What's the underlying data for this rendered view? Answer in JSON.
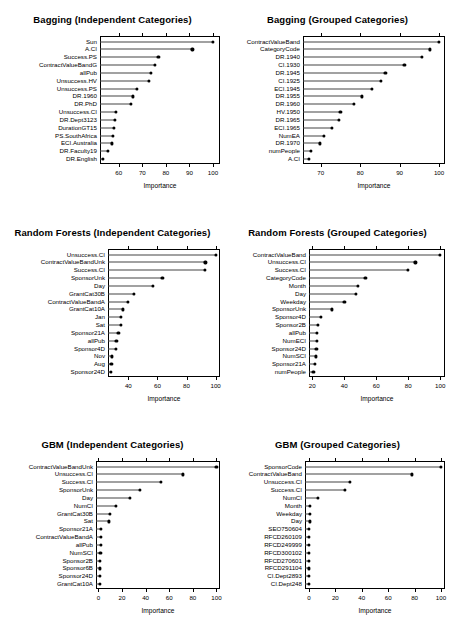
{
  "figure": {
    "kind": "variable-importance-dotplot-grid",
    "columns": 2,
    "rows": 3,
    "axis_title": "Importance"
  },
  "chart_data": [
    {
      "type": "scatter",
      "subtype": "dotchart",
      "title": "Bagging (Independent Categories)",
      "xlabel": "Importance",
      "ylabel": "",
      "xlim": [
        52,
        103
      ],
      "ticks": [
        60,
        70,
        80,
        90,
        100
      ],
      "grid": false,
      "categories": [
        "Sun",
        "A.CI",
        "Success.PS",
        "ContractValueBandG",
        "allPub",
        "Unsuccess.HV",
        "Unsuccess.PS",
        "DR.1960",
        "DR.PhD",
        "Unsuccess.CI",
        "DR.Dept3123",
        "DurationGT15",
        "PS.SouthAfrica",
        "ECI.Australia",
        "DR.Faculty19",
        "DR.English"
      ],
      "values": [
        100.0,
        91.3,
        76.8,
        75.2,
        73.6,
        72.8,
        67.6,
        65.9,
        65.3,
        58.9,
        58.3,
        57.8,
        57.6,
        57.0,
        55.4,
        53.2
      ]
    },
    {
      "type": "scatter",
      "subtype": "dotchart",
      "title": "Bagging (Grouped Categories)",
      "xlabel": "Importance",
      "ylabel": "",
      "xlim": [
        65.5,
        101.5
      ],
      "ticks": [
        70,
        80,
        90,
        100
      ],
      "grid": false,
      "categories": [
        "ContractValueBand",
        "CategoryCode",
        "DR.1940",
        "CI.1930",
        "DR.1945",
        "CI.1925",
        "ECI.1945",
        "DR.1955",
        "DR.1960",
        "HV.1950",
        "DR.1965",
        "ECI.1965",
        "NumEA",
        "DR.1970",
        "numPeople",
        "A.CI"
      ],
      "values": [
        100.0,
        97.6,
        95.7,
        91.2,
        86.4,
        85.3,
        83.0,
        80.4,
        78.5,
        75.0,
        74.7,
        72.8,
        70.7,
        69.8,
        67.5,
        67.0
      ]
    },
    {
      "type": "scatter",
      "subtype": "dotchart",
      "title": "Random Forests (Independent Categories)",
      "xlabel": "Importance",
      "ylabel": "",
      "xlim": [
        26,
        103
      ],
      "ticks": [
        40,
        60,
        80,
        100
      ],
      "grid": false,
      "categories": [
        "Unsuccess.CI",
        "ContractValueBandUnk",
        "Success.CI",
        "SponsorUnk",
        "Day",
        "GrantCat30B",
        "ContractValueBandA",
        "GrantCat10A",
        "Jan",
        "Sat",
        "Sponsor21A",
        "allPub",
        "Sponsor4D",
        "Nov",
        "Aug",
        "Sponsor24D"
      ],
      "values": [
        100.0,
        93.0,
        92.4,
        63.4,
        57.0,
        43.6,
        39.9,
        36.4,
        34.8,
        34.6,
        33.1,
        31.8,
        31.2,
        28.8,
        28.3,
        28.1
      ]
    },
    {
      "type": "scatter",
      "subtype": "dotchart",
      "title": "Random Forests (Grouped Categories)",
      "xlabel": "Importance",
      "ylabel": "",
      "xlim": [
        18,
        103
      ],
      "ticks": [
        20,
        40,
        60,
        80,
        100
      ],
      "grid": false,
      "categories": [
        "ContractValueBand",
        "Unsuccess.CI",
        "Success.CI",
        "CategoryCode",
        "Month",
        "Day",
        "Weekday",
        "SponsorUnk",
        "Sponsor4D",
        "Sponsor2B",
        "allPub",
        "NumECI",
        "Sponsor24D",
        "NumSCI",
        "Sponsor21A",
        "numPeople"
      ],
      "values": [
        100.0,
        84.5,
        79.8,
        53.2,
        48.4,
        47.1,
        40.1,
        32.2,
        25.3,
        23.6,
        23.1,
        22.8,
        22.6,
        22.2,
        21.7,
        20.8
      ]
    },
    {
      "type": "scatter",
      "subtype": "dotchart",
      "title": "GBM (Independent Categories)",
      "xlabel": "Importance",
      "ylabel": "",
      "xlim": [
        -2,
        103
      ],
      "ticks": [
        0,
        20,
        40,
        60,
        80,
        100
      ],
      "grid": false,
      "categories": [
        "ContractValueBandUnk",
        "Unsuccess.CI",
        "Success.CI",
        "SponsorUnk",
        "Day",
        "NumCI",
        "GrantCat30B",
        "Sat",
        "Sponsor21A",
        "ContractValueBandA",
        "allPub",
        "NumSCI",
        "Sponsor2B",
        "Sponsor6B",
        "Sponsor24D",
        "GrantCat10A"
      ],
      "values": [
        100.0,
        71.9,
        53.3,
        35.2,
        26.7,
        14.7,
        9.8,
        8.9,
        2.2,
        2.0,
        1.9,
        1.8,
        1.6,
        1.5,
        1.3,
        1.1
      ]
    },
    {
      "type": "scatter",
      "subtype": "dotchart",
      "title": "GBM (Grouped Categories)",
      "xlabel": "Importance",
      "ylabel": "",
      "xlim": [
        -3,
        103
      ],
      "ticks": [
        0,
        20,
        40,
        60,
        80,
        100
      ],
      "grid": false,
      "categories": [
        "SponsorCode",
        "ContractValueBand",
        "Unsuccess.CI",
        "Success.CI",
        "NumCI",
        "Month",
        "Weekday",
        "Day",
        "SEO750604",
        "RFCD260109",
        "RFCD249999",
        "RFCD300102",
        "RFCD270601",
        "RFCD291104",
        "CI.Dept2893",
        "CI.Dept248"
      ],
      "values": [
        100.0,
        77.8,
        30.7,
        27.0,
        6.8,
        1.0,
        0.8,
        0.6,
        0.0,
        0.0,
        0.0,
        0.0,
        0.0,
        0.0,
        0.0,
        0.0
      ]
    }
  ]
}
